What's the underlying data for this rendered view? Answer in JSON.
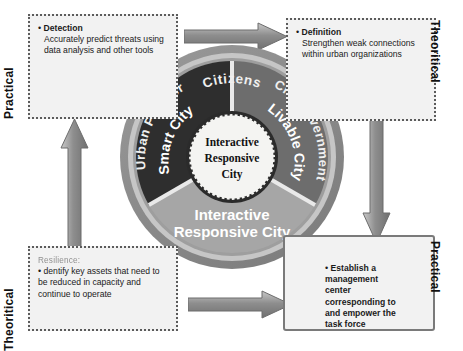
{
  "diagram": {
    "colors": {
      "outer_ring": "#8a8a8a",
      "wedge_dark": "#2e2e2e",
      "wedge_mid": "#6d6d6d",
      "wedge_light": "#a6a6a6",
      "hub": "#f4f4f2",
      "arrow": "#8f8f8f",
      "box_fill": "#f2f2f2",
      "box_border_dotted": "#5b5b5b",
      "box_border_solid": "#7a7a7a"
    }
  },
  "axis_labels": {
    "left_top": "Practical",
    "left_bottom": "Theoritical",
    "right_top": "Theoritical",
    "right_bottom": "Practical"
  },
  "boxes": {
    "detection": {
      "name": "Detection",
      "text": "Accurately predict threats using data analysis and other tools"
    },
    "definition": {
      "name": "Definition",
      "text": "Strengthen weak connections within urban organizations"
    },
    "resilience": {
      "pre_line": "Resilience:",
      "text": "dentify key assets that need to be reduced in capacity and continue to operate"
    },
    "establish": {
      "text": "Establish a management center corresponding to and empower the task force"
    }
  },
  "wheel": {
    "hub_lines": [
      "Interactive",
      "Responsive",
      "City"
    ],
    "outer_labels": {
      "top": "Citizens",
      "right": "City Government",
      "left": "Urban Planner"
    },
    "wedges": {
      "left": "Smart City",
      "right": "Livable City",
      "bottom_lines": [
        "Interactive",
        "Responsive City"
      ]
    }
  },
  "arrows": {
    "top": "arrow-right",
    "right": "arrow-down",
    "bottom": "arrow-right",
    "left": "arrow-up"
  }
}
